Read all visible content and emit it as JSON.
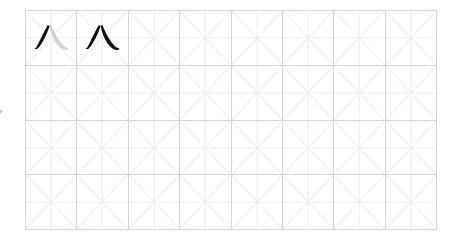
{
  "page": {
    "background_color": "#ffffff",
    "width": 458,
    "height": 246
  },
  "edge_label": {
    "text": "y",
    "color": "#8a8a8a",
    "note": "partially cropped text at the left edge of the image"
  },
  "worksheet": {
    "type": "chinese-character-practice-grid",
    "grid_style": "mi-zi-ge",
    "columns": 8,
    "rows": 4,
    "total_cells": 32,
    "border_color": "#d6d6d6",
    "guide_line_color": "#ededed",
    "ink_color": "#111111",
    "ghost_ink_color": "#d2d2d2",
    "character": "八",
    "filled_cells": [
      {
        "index": 0,
        "row": 1,
        "column": 1,
        "character": "八",
        "mode": "stroke-order",
        "strokes_inked": 1,
        "strokes_ghosted": 1,
        "description": "first stroke (pie) in black, second stroke (na) in light gray"
      },
      {
        "index": 1,
        "row": 1,
        "column": 2,
        "character": "八",
        "mode": "complete",
        "strokes_inked": 2,
        "strokes_ghosted": 0,
        "description": "complete character in black ink"
      }
    ],
    "empty_cells": 30
  }
}
